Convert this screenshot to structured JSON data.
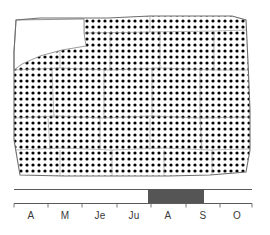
{
  "figure": {
    "type": "distribution-map-with-phenology-timeline",
    "width": 270,
    "height": 235
  },
  "map": {
    "name": "distribution-map",
    "fill_style": "stipple-dots",
    "dot_color": "#000000",
    "background_color": "#ffffff",
    "outline_color": "#6e6e6e",
    "dot_spacing_px": 6,
    "dot_radius_px": 1.6,
    "region_outline": "14,52 16,20 40,18 86,18 108,18 150,16 196,16 232,16 246,20 248,62 250,110 250,150 246,172 210,175 168,176 120,176 64,176 20,175 14,140",
    "unfilled_notch": {
      "name": "top-left-blank-area",
      "description": "white unshaded corner block with faint internal divisions",
      "outline": "16,20 84,19 84,33 86,46 62,50 40,56 22,64 14,70 14,52"
    },
    "internal_boundaries": [
      "16,20 84,19 84,46",
      "84,33 150,32 150,16",
      "150,32 214,31 246,30",
      "14,70 60,68 110,70 160,68 214,70 249,70",
      "60,20 60,68",
      "110,32 110,70",
      "160,31 160,68",
      "214,31 214,70",
      "14,118 56,116 104,118 152,116 200,118 250,117",
      "52,70 54,118",
      "104,70 104,118",
      "152,68 152,118",
      "200,70 200,118",
      "16,150 62,148 112,150 162,148 210,150 250,149",
      "48,118 50,150",
      "100,118 100,150",
      "150,118 150,150",
      "200,118 202,150",
      "60,150 60,176",
      "112,150 112,176",
      "164,150 164,176",
      "212,150 212,176"
    ]
  },
  "timeline": {
    "name": "phenology-timeline",
    "axis_color": "#5a5a5a",
    "highlight_color": "#555555",
    "axis_start_x": 14,
    "axis_end_x": 252,
    "months": [
      {
        "label": "A",
        "center_x": 31
      },
      {
        "label": "M",
        "center_x": 65
      },
      {
        "label": "Je",
        "center_x": 100
      },
      {
        "label": "Ju",
        "center_x": 134
      },
      {
        "label": "A",
        "center_x": 168
      },
      {
        "label": "S",
        "center_x": 203
      },
      {
        "label": "O",
        "center_x": 237
      }
    ],
    "tick_positions_x": [
      14,
      48,
      82,
      117,
      151,
      186,
      220,
      252
    ],
    "highlight_bar": {
      "name": "active-period-bar",
      "start_x": 148,
      "end_x": 204,
      "start_month": "A",
      "end_month": "S"
    }
  }
}
